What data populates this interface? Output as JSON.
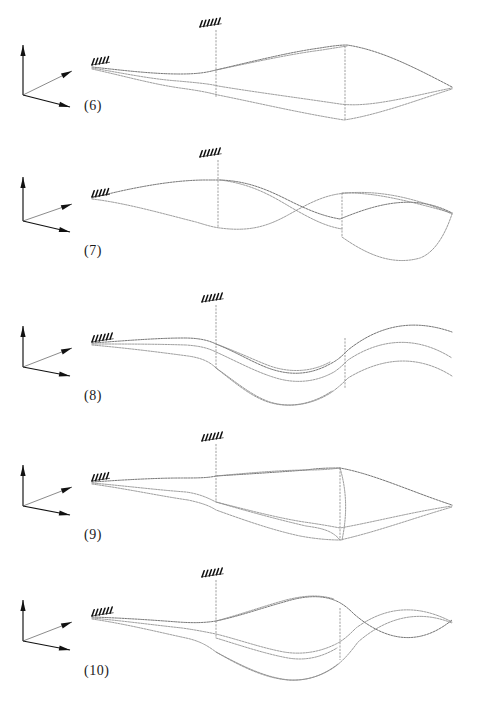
{
  "figure": {
    "type": "mode-shape-plot-series",
    "background_color": "#ffffff",
    "line_color": "#8a8a8a",
    "axis_color": "#111111",
    "panel_count": 5,
    "description_visible_text_only": true
  },
  "panels": [
    {
      "label": "(6)",
      "label_x": 84,
      "label_y": 108,
      "axis": {
        "name": "coordinate-triad",
        "origin_x": 23,
        "origin_y": 95,
        "up_tip_x": 23,
        "up_tip_y": 45,
        "right_up_tip_x": 72,
        "right_up_tip_y": 71,
        "right_down_tip_x": 70,
        "right_down_tip_y": 107
      },
      "supports": [
        {
          "name": "root-support",
          "x": 92,
          "y": 66,
          "ticks": 5
        },
        {
          "name": "mid-support",
          "x": 200,
          "y": 28,
          "ticks": 6
        }
      ],
      "ribs": [
        {
          "x1": 216,
          "y1": 30,
          "x2": 216,
          "y2": 98
        },
        {
          "x1": 345,
          "y1": 46,
          "x2": 345,
          "y2": 120
        }
      ],
      "curves": [
        "M92,67 C120,70 152,74 180,74 C200,74 208,72 216,70 C250,62 290,52 320,48 C332,46 340,45 347,45 C380,50 412,66 452,87",
        "M92,68 C122,73 150,79 178,81 C200,83 210,84 218,86 C254,92 300,98 340,104 C370,108 412,96 452,88",
        "M92,69 C124,76 152,84 180,88 C202,91 210,93 218,95 C258,103 300,113 344,120 C378,115 420,99 452,89",
        "M216,70 C250,63 290,54 322,50 C334,48 341,47 347,46"
      ]
    },
    {
      "label": "(7)",
      "label_x": 84,
      "label_y": 253,
      "axis": {
        "name": "coordinate-triad",
        "origin_x": 23,
        "origin_y": 221,
        "up_tip_x": 23,
        "up_tip_y": 177,
        "right_up_tip_x": 72,
        "right_up_tip_y": 204,
        "right_down_tip_x": 70,
        "right_down_tip_y": 232
      },
      "supports": [
        {
          "name": "root-support",
          "x": 92,
          "y": 198,
          "ticks": 5
        },
        {
          "name": "mid-support",
          "x": 200,
          "y": 158,
          "ticks": 6
        }
      ],
      "ribs": [
        {
          "x1": 218,
          "y1": 160,
          "x2": 218,
          "y2": 228
        },
        {
          "x1": 342,
          "y1": 193,
          "x2": 342,
          "y2": 237
        }
      ],
      "curves": [
        "M92,198 C130,188 172,180 206,180 C212,180 216,180 220,180 C248,181 268,190 288,200 C306,209 322,216 340,219 C372,206 412,192 452,213",
        "M92,199 C126,203 164,214 196,222 C206,225 212,227 220,228 C250,232 268,226 288,215 C306,205 320,197 338,194 C372,189 412,196 452,214",
        "M220,180 C252,184 272,196 292,208 C310,218 324,226 342,229",
        "M342,193 C372,192 406,200 452,213",
        "M342,237 C366,254 392,266 420,258 C436,252 446,232 452,214"
      ]
    },
    {
      "label": "(8)",
      "label_x": 84,
      "label_y": 398,
      "axis": {
        "name": "coordinate-triad",
        "origin_x": 23,
        "origin_y": 367,
        "up_tip_x": 23,
        "up_tip_y": 326,
        "right_up_tip_x": 72,
        "right_up_tip_y": 348,
        "right_down_tip_x": 70,
        "right_down_tip_y": 376
      },
      "supports": [
        {
          "name": "root-support",
          "x": 92,
          "y": 343,
          "ticks": 6
        },
        {
          "name": "mid-support",
          "x": 202,
          "y": 303,
          "ticks": 6
        }
      ],
      "ribs": [
        {
          "x1": 216,
          "y1": 305,
          "x2": 216,
          "y2": 368
        },
        {
          "x1": 345,
          "y1": 338,
          "x2": 345,
          "y2": 388
        }
      ],
      "curves": [
        "M92,343 C122,341 156,338 184,338 C198,338 208,340 216,344 C236,352 252,362 268,368 C290,376 310,375 330,364 C338,360 342,356 348,350 C378,326 412,318 452,332",
        "M92,344 C124,344 156,344 186,345 C200,346 208,348 216,352 C238,362 256,372 276,378 C296,384 316,382 334,372 C340,368 344,364 348,360 C378,340 414,334 452,358",
        "M92,345 C126,348 158,352 188,356 C202,358 210,362 216,368 C234,382 250,396 268,402 C290,409 314,404 332,392 C340,386 344,382 348,378 C378,360 414,352 452,376",
        "M216,344 C238,352 254,360 270,366 C290,373 312,372 330,362",
        "M216,368 C236,382 252,396 270,402 C292,409 314,403 332,391"
      ]
    },
    {
      "label": "(9)",
      "label_x": 84,
      "label_y": 537,
      "axis": {
        "name": "coordinate-triad",
        "origin_x": 23,
        "origin_y": 506,
        "up_tip_x": 23,
        "up_tip_y": 465,
        "right_up_tip_x": 72,
        "right_up_tip_y": 487,
        "right_down_tip_x": 70,
        "right_down_tip_y": 515
      },
      "supports": [
        {
          "name": "root-support",
          "x": 92,
          "y": 482,
          "ticks": 5
        },
        {
          "name": "mid-support",
          "x": 202,
          "y": 442,
          "ticks": 6
        }
      ],
      "ribs": [
        {
          "x1": 216,
          "y1": 444,
          "x2": 216,
          "y2": 502
        },
        {
          "x1": 340,
          "y1": 468,
          "x2": 340,
          "y2": 540
        }
      ],
      "curves": [
        "M92,482 C122,480 154,478 182,478 C196,478 208,478 216,476 C248,474 280,472 306,470 C320,468 330,468 340,468 C374,474 412,492 452,505",
        "M92,483 C126,486 158,490 186,492 C200,494 208,498 216,502 C248,510 278,518 304,522 C318,524 330,526 340,528 C374,522 412,512 452,506",
        "M92,484 C128,489 160,496 188,500 C202,503 210,506 216,510 C244,520 272,530 300,536 C316,539 330,540 340,540 C376,532 414,518 452,507",
        "M216,476 C248,473 282,470 308,470 C322,470 332,469 340,468",
        "M340,468 C346,488 348,512 342,540",
        "M216,502 C250,512 280,520 306,526 C320,528 332,530 340,540"
      ]
    },
    {
      "label": "(10)",
      "label_x": 84,
      "label_y": 673,
      "axis": {
        "name": "coordinate-triad",
        "origin_x": 23,
        "origin_y": 641,
        "up_tip_x": 23,
        "up_tip_y": 600,
        "right_up_tip_x": 72,
        "right_up_tip_y": 622,
        "right_down_tip_x": 70,
        "right_down_tip_y": 650
      },
      "supports": [
        {
          "name": "root-support",
          "x": 92,
          "y": 617,
          "ticks": 6
        },
        {
          "name": "mid-support",
          "x": 202,
          "y": 578,
          "ticks": 6
        }
      ],
      "ribs": [
        {
          "x1": 216,
          "y1": 580,
          "x2": 216,
          "y2": 638
        },
        {
          "x1": 340,
          "y1": 608,
          "x2": 340,
          "y2": 660
        }
      ],
      "curves": [
        "M92,617 C122,618 152,620 178,622 C192,623 204,623 216,621 C240,616 262,608 284,602 C300,597 318,594 334,600 C342,603 348,608 354,614 C384,640 418,648 452,620",
        "M92,618 C124,621 154,625 182,628 C196,630 206,632 216,634 C240,640 262,648 284,652 C302,655 320,652 336,644 C344,640 350,634 356,628 C386,606 418,604 452,622",
        "M92,619 C126,624 158,632 186,638 C200,641 208,646 216,652 C240,666 264,678 288,680 C306,681 322,676 336,666 C346,658 352,650 358,642 C388,616 420,610 452,623",
        "M216,621 C242,614 264,606 286,600 C302,596 318,594 334,599",
        "M216,638 C242,646 266,654 288,658 C306,661 322,657 337,648",
        "M216,652 C242,666 266,678 290,680 C308,681 324,675 338,664"
      ]
    }
  ]
}
